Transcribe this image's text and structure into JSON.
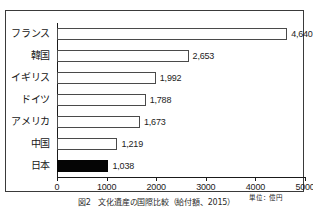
{
  "chart_data": {
    "type": "bar",
    "orientation": "horizontal",
    "title": "",
    "xlabel": "",
    "ylabel": "",
    "unit_note": "単位：億円",
    "caption": "図2　文化遺産の国際比較（給付額、2015）",
    "categories": [
      "フランス",
      "韓国",
      "イギリス",
      "ドイツ",
      "アメリカ",
      "中国",
      "日本"
    ],
    "values": [
      4640,
      2653,
      1992,
      1788,
      1673,
      1219,
      1038
    ],
    "value_labels": [
      "4,640",
      "2,653",
      "1,992",
      "1,788",
      "1,673",
      "1,219",
      "1,038"
    ],
    "highlight_index": 6,
    "xlim": [
      0,
      5000
    ],
    "xticks": [
      0,
      1000,
      2000,
      3000,
      4000,
      5000
    ],
    "xtick_labels": [
      "0",
      "1000",
      "2000",
      "3000",
      "4000",
      "5000"
    ],
    "grid": false,
    "legend": "none",
    "bar_fill_default": "#ffffff",
    "bar_fill_highlight": "#050505",
    "bar_stroke": "#4a4a4a",
    "axis_color": "#1a1a1a"
  }
}
